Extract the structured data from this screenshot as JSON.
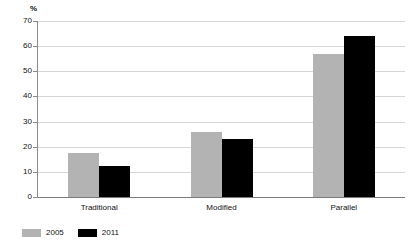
{
  "chart_data": {
    "type": "bar",
    "title": "",
    "subtitle": "",
    "xlabel": "",
    "ylabel": "%",
    "ylim": [
      0,
      70
    ],
    "ytick_step": 10,
    "yticks": [
      0,
      10,
      20,
      30,
      40,
      50,
      60,
      70
    ],
    "ytick_labels": [
      "0",
      "10",
      "20",
      "30",
      "40",
      "50",
      "60",
      "70"
    ],
    "grid": true,
    "grid_axis": "y",
    "legend_position": "bottom-left",
    "categories": [
      "Traditional",
      "Modified",
      "Parallel"
    ],
    "series": [
      {
        "name": "2005",
        "color": "#b3b3b3",
        "values": [
          17.5,
          26,
          57
        ]
      },
      {
        "name": "2011",
        "color": "#000000",
        "values": [
          12.5,
          23,
          64
        ]
      }
    ]
  },
  "axis": {
    "unit_label": "%"
  },
  "legend": {
    "items": [
      {
        "label": "2005",
        "color": "#b3b3b3"
      },
      {
        "label": "2011",
        "color": "#000000"
      }
    ]
  },
  "colors": {
    "series_a": "#b3b3b3",
    "series_b": "#000000",
    "gridline": "#d6d6d6",
    "axis": "#8a8a8a",
    "baseline": "#7a7a7a",
    "background": "#ffffff",
    "text": "#111111"
  }
}
